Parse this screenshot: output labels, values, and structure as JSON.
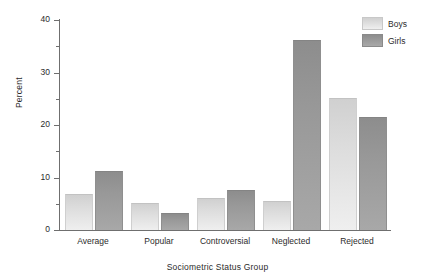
{
  "chart_data": {
    "type": "bar",
    "title": "",
    "xlabel": "Sociometric Status Group",
    "ylabel": "Percent",
    "categories": [
      "Average",
      "Popular",
      "Controversial",
      "Neglected",
      "Rejected"
    ],
    "series": [
      {
        "name": "Boys",
        "color": "#dcdcdc",
        "values": [
          6.7,
          5.0,
          6.0,
          5.3,
          25.0
        ]
      },
      {
        "name": "Girls",
        "color": "#989898",
        "values": [
          11.0,
          3.0,
          7.5,
          36.0,
          21.3
        ]
      }
    ],
    "ylim": [
      0,
      40
    ],
    "yticks": [
      0,
      10,
      20,
      30,
      40
    ],
    "ytick_labels": [
      "0",
      "10",
      "20",
      "30",
      "40"
    ],
    "yminor_ticks": [
      5,
      15,
      25,
      35
    ],
    "grid": false,
    "legend_position": "top-right"
  },
  "legend": {
    "items": [
      {
        "label": "Boys"
      },
      {
        "label": "Girls"
      }
    ]
  },
  "axes": {
    "y_title": "Percent",
    "x_title": "Sociometric Status Group"
  }
}
